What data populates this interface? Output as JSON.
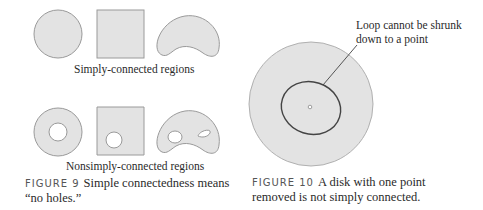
{
  "figure9": {
    "simply_label": "Simply-connected regions",
    "nonsimply_label": "Nonsimply-connected regions",
    "caption_label": "FIGURE 9",
    "caption_line1": "Simple connectedness means",
    "caption_line2": "“no holes.”",
    "shapes_simply": [
      "disk",
      "square",
      "kidney"
    ],
    "shapes_nonsimply": [
      "annulus",
      "square-with-hole",
      "kidney-with-two-holes"
    ]
  },
  "figure10": {
    "annotation_line1": "Loop cannot be shrunk",
    "annotation_line2": "down to a point",
    "caption_label": "FIGURE 10",
    "caption_line1": "A disk with one point",
    "caption_line2": "removed is not simply connected."
  },
  "colors": {
    "fill": "#e3e3e3",
    "stroke": "#9a9a9a",
    "loop": "#444444"
  }
}
